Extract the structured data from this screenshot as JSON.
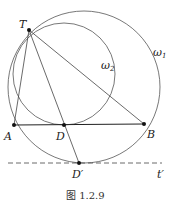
{
  "diagram": {
    "points": {
      "T": {
        "label": "T",
        "x": 29,
        "y": 30
      },
      "A": {
        "label": "A",
        "x": 14,
        "y": 125
      },
      "D": {
        "label": "D",
        "x": 64,
        "y": 125
      },
      "B": {
        "label": "B",
        "x": 144,
        "y": 124
      },
      "Dp": {
        "label": "D′",
        "x": 79,
        "y": 163
      }
    },
    "circles": {
      "omega1": {
        "label": "ω",
        "sub": "1",
        "cx": 84,
        "cy": 87,
        "r": 76
      },
      "omega2": {
        "label": "ω",
        "sub": "2",
        "cx": 64,
        "cy": 74,
        "r": 51
      }
    },
    "line_t": {
      "label": "t′"
    },
    "caption": "图 1.2.9"
  }
}
